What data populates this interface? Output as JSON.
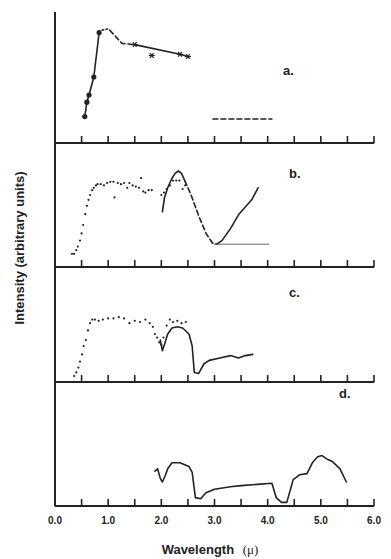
{
  "chart_data": {
    "type": "line",
    "title": "",
    "xlabel": "Wavelength",
    "xlabel_unit": "(μ)",
    "ylabel": "Intensity (arbitrary units)",
    "xlim": [
      0.0,
      6.0
    ],
    "x_ticks": [
      0.0,
      0.5,
      1.0,
      1.5,
      2.0,
      2.5,
      3.0,
      3.5,
      4.0,
      4.5,
      5.0,
      5.5,
      6.0
    ],
    "x_tick_labels": [
      "0.0",
      "1.0",
      "2.0",
      "3.0",
      "4.0",
      "5.0",
      "6.0"
    ],
    "grid": false,
    "legend": "none",
    "panels": [
      {
        "label": "a.",
        "series": [
          {
            "name": "a-dots-solid",
            "style": "solid",
            "marker": "dot",
            "points": [
              [
                0.56,
                0.22
              ],
              [
                0.6,
                0.34
              ],
              [
                0.64,
                0.4
              ],
              [
                0.73,
                0.55
              ],
              [
                0.83,
                0.92
              ]
            ]
          },
          {
            "name": "a-peak-dotted",
            "style": "dotted",
            "marker": "none",
            "points": [
              [
                0.83,
                0.92
              ],
              [
                0.88,
                0.94
              ],
              [
                0.99,
                0.95
              ]
            ]
          },
          {
            "name": "a-dashed",
            "style": "dashed",
            "marker": "none",
            "points": [
              [
                1.03,
                0.94
              ],
              [
                1.26,
                0.83
              ],
              [
                1.5,
                0.82
              ]
            ]
          },
          {
            "name": "a-stars",
            "style": "solid",
            "marker": "star",
            "points": [
              [
                1.5,
                0.82
              ],
              [
                2.35,
                0.74
              ],
              [
                2.5,
                0.72
              ]
            ]
          },
          {
            "name": "a-star-outlier",
            "style": "none",
            "marker": "star",
            "points": [
              [
                1.82,
                0.73
              ]
            ]
          },
          {
            "name": "a-dashed-flat",
            "style": "dashed",
            "marker": "none",
            "points": [
              [
                2.97,
                0.2
              ],
              [
                4.08,
                0.2
              ]
            ]
          }
        ]
      },
      {
        "label": "b.",
        "series": [
          {
            "name": "b-dots",
            "style": "none",
            "marker": "dot",
            "points": [
              [
                0.32,
                0.11
              ],
              [
                0.36,
                0.11
              ],
              [
                0.4,
                0.14
              ],
              [
                0.43,
                0.17
              ],
              [
                0.47,
                0.22
              ],
              [
                0.5,
                0.28
              ],
              [
                0.53,
                0.35
              ],
              [
                0.57,
                0.44
              ],
              [
                0.6,
                0.51
              ],
              [
                0.63,
                0.56
              ],
              [
                0.66,
                0.6
              ],
              [
                0.7,
                0.64
              ],
              [
                0.73,
                0.66
              ],
              [
                0.77,
                0.68
              ],
              [
                0.8,
                0.69
              ],
              [
                0.86,
                0.69
              ],
              [
                0.92,
                0.68
              ],
              [
                0.98,
                0.7
              ],
              [
                1.04,
                0.71
              ],
              [
                1.1,
                0.71
              ],
              [
                1.12,
                0.58
              ],
              [
                1.18,
                0.7
              ],
              [
                1.24,
                0.69
              ],
              [
                1.3,
                0.7
              ],
              [
                1.36,
                0.66
              ],
              [
                1.4,
                0.7
              ],
              [
                1.46,
                0.68
              ],
              [
                1.52,
                0.67
              ],
              [
                1.58,
                0.66
              ],
              [
                1.62,
                0.74
              ],
              [
                1.66,
                0.63
              ],
              [
                1.7,
                0.62
              ],
              [
                1.76,
                0.64
              ],
              [
                1.82,
                0.64
              ],
              [
                2.0,
                0.6
              ],
              [
                2.05,
                0.62
              ],
              [
                2.1,
                0.65
              ],
              [
                2.16,
                0.68
              ],
              [
                2.22,
                0.72
              ],
              [
                2.28,
                0.72
              ],
              [
                2.34,
                0.72
              ],
              [
                2.4,
                0.65
              ],
              [
                2.45,
                0.68
              ]
            ]
          },
          {
            "name": "b-solid-rise",
            "style": "solid",
            "marker": "none",
            "points": [
              [
                2.02,
                0.46
              ],
              [
                2.06,
                0.58
              ],
              [
                2.12,
                0.66
              ],
              [
                2.2,
                0.74
              ],
              [
                2.26,
                0.78
              ],
              [
                2.32,
                0.8
              ],
              [
                2.38,
                0.78
              ],
              [
                2.44,
                0.72
              ]
            ]
          },
          {
            "name": "b-dashed-fall",
            "style": "dashed",
            "marker": "none",
            "points": [
              [
                2.44,
                0.72
              ],
              [
                2.56,
                0.6
              ],
              [
                2.7,
                0.43
              ],
              [
                2.84,
                0.28
              ],
              [
                2.96,
                0.2
              ],
              [
                3.04,
                0.19
              ]
            ]
          },
          {
            "name": "b-solid-rise2",
            "style": "solid",
            "marker": "none",
            "points": [
              [
                3.04,
                0.19
              ],
              [
                3.14,
                0.22
              ],
              [
                3.3,
                0.32
              ],
              [
                3.46,
                0.44
              ],
              [
                3.58,
                0.5
              ],
              [
                3.7,
                0.56
              ],
              [
                3.82,
                0.66
              ]
            ]
          },
          {
            "name": "b-flat-thin",
            "style": "thin",
            "marker": "none",
            "points": [
              [
                3.0,
                0.19
              ],
              [
                4.02,
                0.19
              ]
            ]
          }
        ]
      },
      {
        "label": "c.",
        "series": [
          {
            "name": "c-dots",
            "style": "none",
            "marker": "dot",
            "points": [
              [
                0.36,
                0.05
              ],
              [
                0.4,
                0.08
              ],
              [
                0.44,
                0.12
              ],
              [
                0.47,
                0.17
              ],
              [
                0.51,
                0.23
              ],
              [
                0.54,
                0.3
              ],
              [
                0.58,
                0.35
              ],
              [
                0.62,
                0.43
              ],
              [
                0.66,
                0.49
              ],
              [
                0.7,
                0.52
              ],
              [
                0.75,
                0.52
              ],
              [
                0.82,
                0.51
              ],
              [
                0.9,
                0.52
              ],
              [
                1.0,
                0.53
              ],
              [
                1.1,
                0.53
              ],
              [
                1.2,
                0.54
              ],
              [
                1.3,
                0.53
              ],
              [
                1.4,
                0.49
              ],
              [
                1.5,
                0.51
              ],
              [
                1.6,
                0.5
              ],
              [
                1.7,
                0.52
              ],
              [
                1.78,
                0.49
              ],
              [
                1.84,
                0.46
              ],
              [
                1.88,
                0.4
              ],
              [
                1.92,
                0.37
              ],
              [
                1.96,
                0.33
              ],
              [
                2.0,
                0.31
              ],
              [
                2.04,
                0.37
              ],
              [
                2.1,
                0.47
              ],
              [
                2.16,
                0.52
              ],
              [
                2.22,
                0.5
              ],
              [
                2.3,
                0.51
              ],
              [
                2.38,
                0.49
              ],
              [
                2.46,
                0.5
              ]
            ]
          },
          {
            "name": "c-solid-dip",
            "style": "solid",
            "marker": "none",
            "points": [
              [
                1.98,
                0.35
              ],
              [
                2.02,
                0.26
              ],
              [
                2.07,
                0.33
              ],
              [
                2.12,
                0.4
              ],
              [
                2.2,
                0.45
              ],
              [
                2.3,
                0.46
              ],
              [
                2.4,
                0.45
              ],
              [
                2.52,
                0.4
              ],
              [
                2.58,
                0.3
              ],
              [
                2.62,
                0.08
              ],
              [
                2.7,
                0.07
              ],
              [
                2.8,
                0.15
              ],
              [
                2.9,
                0.18
              ],
              [
                3.1,
                0.2
              ],
              [
                3.3,
                0.22
              ],
              [
                3.45,
                0.2
              ],
              [
                3.58,
                0.22
              ],
              [
                3.72,
                0.23
              ]
            ]
          }
        ]
      },
      {
        "label": "d.",
        "series": [
          {
            "name": "d-solid",
            "style": "solid",
            "marker": "none",
            "points": [
              [
                1.88,
                0.29
              ],
              [
                1.93,
                0.31
              ],
              [
                1.98,
                0.23
              ],
              [
                2.02,
                0.2
              ],
              [
                2.08,
                0.26
              ],
              [
                2.12,
                0.31
              ],
              [
                2.2,
                0.36
              ],
              [
                2.35,
                0.36
              ],
              [
                2.52,
                0.33
              ],
              [
                2.58,
                0.28
              ],
              [
                2.64,
                0.07
              ],
              [
                2.74,
                0.06
              ],
              [
                2.84,
                0.11
              ],
              [
                3.0,
                0.14
              ],
              [
                3.3,
                0.16
              ],
              [
                3.5,
                0.17
              ],
              [
                3.8,
                0.18
              ],
              [
                4.08,
                0.19
              ],
              [
                4.16,
                0.07
              ],
              [
                4.26,
                0.03
              ],
              [
                4.36,
                0.03
              ],
              [
                4.48,
                0.22
              ],
              [
                4.6,
                0.26
              ],
              [
                4.74,
                0.27
              ],
              [
                4.84,
                0.36
              ],
              [
                4.94,
                0.41
              ],
              [
                5.02,
                0.42
              ],
              [
                5.12,
                0.39
              ],
              [
                5.22,
                0.37
              ],
              [
                5.36,
                0.31
              ],
              [
                5.48,
                0.2
              ]
            ]
          }
        ]
      }
    ]
  },
  "layout": {
    "plot_left_px": 55,
    "plot_right_px": 374,
    "top_px": 12,
    "panel_baselines_px": [
      143,
      267,
      382,
      506
    ],
    "y_scale_px_per_unit": 120,
    "ink_color": "#222222"
  }
}
